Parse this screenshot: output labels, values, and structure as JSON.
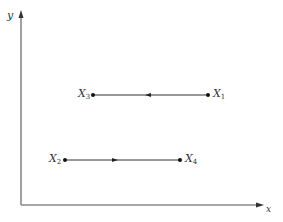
{
  "diagram": {
    "axes": {
      "x_label": "x",
      "y_label": "y",
      "color": "#888888"
    },
    "points": {
      "X1": {
        "name": "X",
        "sub": "1"
      },
      "X2": {
        "name": "X",
        "sub": "2"
      },
      "X3": {
        "name": "X",
        "sub": "3"
      },
      "X4": {
        "name": "X",
        "sub": "4"
      }
    },
    "segments": [
      {
        "from": "X1",
        "to": "X3",
        "direction": "left"
      },
      {
        "from": "X2",
        "to": "X4",
        "direction": "right"
      }
    ],
    "line_color": "#222222"
  }
}
